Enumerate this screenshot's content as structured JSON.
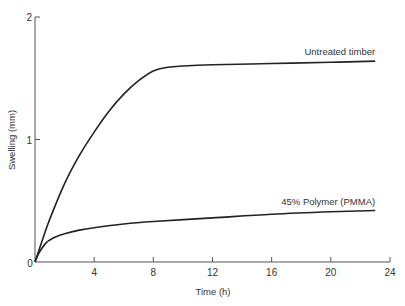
{
  "chart_data": {
    "type": "line",
    "title": "",
    "xlabel": "Time (h)",
    "ylabel": "Swelling (mm)",
    "xlim": [
      0,
      24
    ],
    "ylim": [
      0,
      2
    ],
    "x_ticks": [
      "0",
      "4",
      "8",
      "12",
      "16",
      "20",
      "24"
    ],
    "y_ticks": [
      "0",
      "1",
      "2"
    ],
    "grid": false,
    "series": [
      {
        "name": "Untreated timber",
        "x": [
          0,
          0.5,
          1,
          2,
          3,
          4,
          5,
          6,
          7,
          8,
          9,
          10,
          12,
          16,
          20,
          23
        ],
        "y": [
          0,
          0.18,
          0.35,
          0.64,
          0.87,
          1.06,
          1.23,
          1.37,
          1.48,
          1.56,
          1.59,
          1.6,
          1.61,
          1.62,
          1.63,
          1.64
        ]
      },
      {
        "name": "45% Polymer (PMMA)",
        "x": [
          0,
          0.3,
          0.7,
          1,
          1.5,
          2,
          3,
          4,
          6,
          8,
          12,
          16,
          20,
          23
        ],
        "y": [
          0,
          0.08,
          0.15,
          0.18,
          0.21,
          0.23,
          0.26,
          0.28,
          0.31,
          0.33,
          0.36,
          0.39,
          0.41,
          0.42
        ]
      }
    ]
  }
}
